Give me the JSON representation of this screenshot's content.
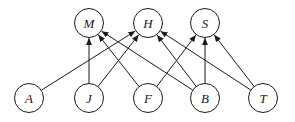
{
  "diagram": {
    "type": "directed-bipartite-graph",
    "node_radius": 14.5,
    "nodes": [
      {
        "id": "M",
        "label": "M",
        "x": 89,
        "y": 23,
        "row": "top"
      },
      {
        "id": "H",
        "label": "H",
        "x": 148,
        "y": 23,
        "row": "top"
      },
      {
        "id": "S",
        "label": "S",
        "x": 205,
        "y": 23,
        "row": "top"
      },
      {
        "id": "A",
        "label": "A",
        "x": 29,
        "y": 98,
        "row": "bottom"
      },
      {
        "id": "J",
        "label": "J",
        "x": 89,
        "y": 98,
        "row": "bottom"
      },
      {
        "id": "F",
        "label": "F",
        "x": 148,
        "y": 98,
        "row": "bottom"
      },
      {
        "id": "B",
        "label": "B",
        "x": 205,
        "y": 98,
        "row": "bottom"
      },
      {
        "id": "T",
        "label": "T",
        "x": 263,
        "y": 98,
        "row": "bottom"
      }
    ],
    "edges": [
      {
        "from": "A",
        "to": "H"
      },
      {
        "from": "J",
        "to": "M"
      },
      {
        "from": "J",
        "to": "H"
      },
      {
        "from": "F",
        "to": "M"
      },
      {
        "from": "F",
        "to": "S"
      },
      {
        "from": "B",
        "to": "M"
      },
      {
        "from": "B",
        "to": "H"
      },
      {
        "from": "B",
        "to": "S"
      },
      {
        "from": "T",
        "to": "H"
      },
      {
        "from": "T",
        "to": "S"
      }
    ],
    "colors": {
      "stroke": "#1a1a1a",
      "fill": "#ffffff",
      "background": "#ffffff"
    }
  }
}
